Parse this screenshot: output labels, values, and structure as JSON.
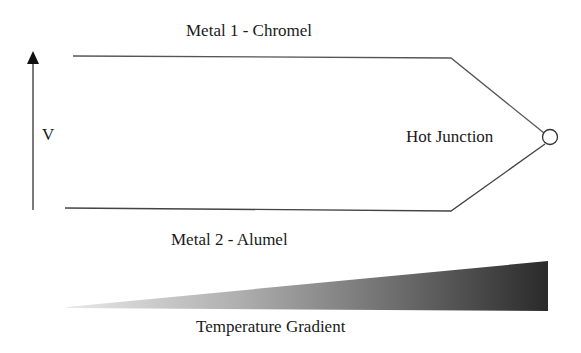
{
  "diagram": {
    "labels": {
      "metal1": "Metal 1 - Chromel",
      "metal2": "Metal 2 - Alumel",
      "voltage": "V",
      "junction": "Hot Junction",
      "gradient": "Temperature Gradient"
    },
    "colors": {
      "line": "#555555",
      "text": "#1a1a1a",
      "gradient_start": "#e6e6e6",
      "gradient_end": "#2a2a2a"
    }
  }
}
